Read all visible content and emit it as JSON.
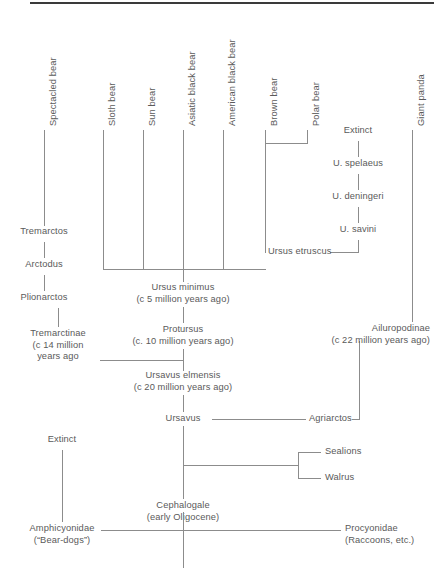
{
  "figure": {
    "line_color": "#8c8c8c",
    "text_color": "#5a5a5a",
    "rule_color": "#3a3a3a",
    "background": "#ffffff"
  },
  "extant_taxa": [
    {
      "label": "Spectacled bear"
    },
    {
      "label": "Sloth bear"
    },
    {
      "label": "Sun bear"
    },
    {
      "label": "Asiatic black bear"
    },
    {
      "label": "American black bear"
    },
    {
      "label": "Brown bear"
    },
    {
      "label": "Polar bear"
    },
    {
      "label": "Giant panda"
    }
  ],
  "cave_bear_lineage": [
    {
      "label": "Extinct"
    },
    {
      "label": "U. spelaeus"
    },
    {
      "label": "U. deningeri"
    },
    {
      "label": "U. savini"
    }
  ],
  "tremarctine_lineage": [
    {
      "label": "Tremarctos"
    },
    {
      "label": "Arctodus"
    },
    {
      "label": "Plionarctos"
    }
  ],
  "nodes": {
    "ursus_etruscus": {
      "label": "Ursus etruscus"
    },
    "tremarctinae": {
      "line1": "Tremarctinae",
      "line2": "(c 14 million",
      "line3": "years ago"
    },
    "ursus_minimus": {
      "line1": "Ursus minimus",
      "line2": "(c 5 million years ago)"
    },
    "protursus": {
      "line1": "Protursus",
      "line2": "(c. 10 million years ago)"
    },
    "ursavus_elmensis": {
      "line1": "Ursavus elmensis",
      "line2": "(c 20 million years ago)"
    },
    "ursavus": {
      "label": "Ursavus"
    },
    "agriarctos": {
      "label": "Agriarctos"
    },
    "ailuropodinae": {
      "line1": "Ailuropodinae",
      "line2": "(c 22 million years ago)"
    },
    "sealions": {
      "label": "Sealions"
    },
    "walrus": {
      "label": "Walrus"
    },
    "extinct_bear_dogs": {
      "label": "Extinct"
    },
    "cephalogale": {
      "line1": "Cephalogale",
      "line2": "(early Oligocene)"
    },
    "amphicyonidae": {
      "line1": "Amphicyonidae",
      "line2": "(“Bear-dogs”)"
    },
    "procyonidae": {
      "line1": "Procyonidae",
      "line2": "(Raccoons, etc.)"
    }
  }
}
